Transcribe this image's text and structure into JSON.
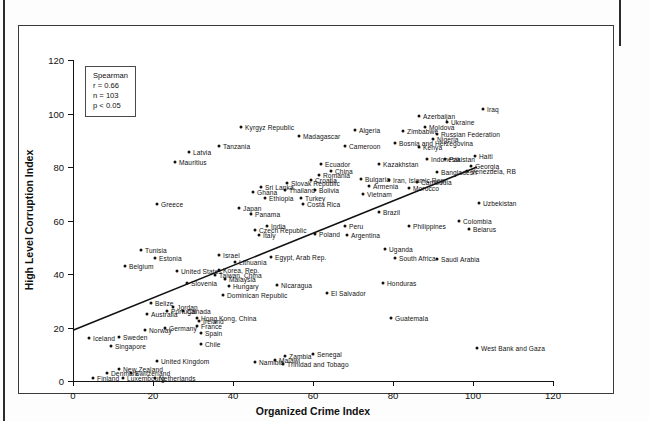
{
  "figure": {
    "stats": {
      "method": "Spearman",
      "r": "r = 0.66",
      "n": "n = 103",
      "p": "p < 0.05"
    }
  },
  "chart_data": {
    "type": "scatter",
    "title": "",
    "xlabel": "Organized Crime Index",
    "ylabel": "High Level Corruption Index",
    "xlim": [
      0,
      120
    ],
    "ylim": [
      0,
      120
    ],
    "xticks": [
      0,
      20,
      40,
      60,
      80,
      100,
      120
    ],
    "yticks": [
      0,
      20,
      40,
      60,
      80,
      100,
      120
    ],
    "grid": false,
    "legend": null,
    "annotation": "Spearman r = 0.66, n = 103, p < 0.05",
    "trendline": {
      "x0": 0,
      "y0": 19,
      "x1": 101,
      "y1": 80
    },
    "point_labels": "country names",
    "points": [
      {
        "label": "Iraq",
        "x": 102.5,
        "y": 101.5,
        "side": "right"
      },
      {
        "label": "Azerbaijan",
        "x": 86.5,
        "y": 99.0,
        "side": "right"
      },
      {
        "label": "Ukraine",
        "x": 93.5,
        "y": 97.0,
        "side": "right"
      },
      {
        "label": "Moldova",
        "x": 88.0,
        "y": 95.0,
        "side": "right"
      },
      {
        "label": "Zimbabwe",
        "x": 82.5,
        "y": 93.5,
        "side": "right"
      },
      {
        "label": "Russian Federation",
        "x": 91.0,
        "y": 92.5,
        "side": "right"
      },
      {
        "label": "Nigeria",
        "x": 90.0,
        "y": 90.5,
        "side": "right"
      },
      {
        "label": "Algeria",
        "x": 70.5,
        "y": 94.0,
        "side": "right"
      },
      {
        "label": "Bosnia and Herzegovina",
        "x": 80.5,
        "y": 89.0,
        "side": "right"
      },
      {
        "label": "Kenya",
        "x": 86.5,
        "y": 87.5,
        "side": "right"
      },
      {
        "label": "Cameroon",
        "x": 68.0,
        "y": 88.0,
        "side": "right"
      },
      {
        "label": "Kyrgyz Republic",
        "x": 42.0,
        "y": 95.0,
        "side": "right"
      },
      {
        "label": "Madagascar",
        "x": 56.5,
        "y": 91.5,
        "side": "right"
      },
      {
        "label": "Tanzania",
        "x": 36.5,
        "y": 88.0,
        "side": "right"
      },
      {
        "label": "Latvia",
        "x": 29.0,
        "y": 85.5,
        "side": "right"
      },
      {
        "label": "Mauritius",
        "x": 25.5,
        "y": 82.0,
        "side": "right"
      },
      {
        "label": "Indonesia",
        "x": 88.5,
        "y": 83.0,
        "side": "right"
      },
      {
        "label": "Pakistan",
        "x": 93.0,
        "y": 83.0,
        "side": "right"
      },
      {
        "label": "Haiti",
        "x": 100.5,
        "y": 84.0,
        "side": "right"
      },
      {
        "label": "Kazakhstan",
        "x": 76.5,
        "y": 81.0,
        "side": "right"
      },
      {
        "label": "Georgia",
        "x": 99.5,
        "y": 80.5,
        "side": "right"
      },
      {
        "label": "Bangladesh",
        "x": 91.0,
        "y": 78.0,
        "side": "right"
      },
      {
        "label": "Venezuela, RB",
        "x": 98.5,
        "y": 78.5,
        "side": "right"
      },
      {
        "label": "Ecuador",
        "x": 62.0,
        "y": 81.0,
        "side": "right"
      },
      {
        "label": "China",
        "x": 64.5,
        "y": 78.5,
        "side": "right"
      },
      {
        "label": "Romania",
        "x": 61.5,
        "y": 77.0,
        "side": "right"
      },
      {
        "label": "Croatia",
        "x": 59.5,
        "y": 75.0,
        "side": "right"
      },
      {
        "label": "Bulgaria",
        "x": 72.0,
        "y": 75.5,
        "side": "right"
      },
      {
        "label": "Iran, Islamic Rep.",
        "x": 79.0,
        "y": 75.0,
        "side": "right"
      },
      {
        "label": "Cambodia",
        "x": 86.0,
        "y": 74.5,
        "side": "right"
      },
      {
        "label": "Armenia",
        "x": 74.0,
        "y": 73.0,
        "side": "right"
      },
      {
        "label": "Morocco",
        "x": 84.0,
        "y": 72.0,
        "side": "right"
      },
      {
        "label": "Slovak Republic",
        "x": 53.5,
        "y": 74.0,
        "side": "right"
      },
      {
        "label": "Sri Lanka",
        "x": 47.0,
        "y": 72.5,
        "side": "right"
      },
      {
        "label": "Thailand",
        "x": 53.0,
        "y": 71.5,
        "side": "right"
      },
      {
        "label": "Bolivia",
        "x": 60.5,
        "y": 71.5,
        "side": "right"
      },
      {
        "label": "Vietnam",
        "x": 72.5,
        "y": 70.0,
        "side": "right"
      },
      {
        "label": "Turkey",
        "x": 57.0,
        "y": 68.5,
        "side": "right"
      },
      {
        "label": "Costa Rica",
        "x": 57.5,
        "y": 66.0,
        "side": "right"
      },
      {
        "label": "Ethiopia",
        "x": 48.0,
        "y": 68.5,
        "side": "right"
      },
      {
        "label": "Ghana",
        "x": 45.0,
        "y": 70.5,
        "side": "right"
      },
      {
        "label": "Uzbekistan",
        "x": 101.5,
        "y": 66.5,
        "side": "right"
      },
      {
        "label": "Greece",
        "x": 21.0,
        "y": 66.0,
        "side": "right"
      },
      {
        "label": "Japan",
        "x": 41.5,
        "y": 64.5,
        "side": "right"
      },
      {
        "label": "Panama",
        "x": 44.5,
        "y": 62.5,
        "side": "right"
      },
      {
        "label": "Brazil",
        "x": 76.5,
        "y": 63.0,
        "side": "right"
      },
      {
        "label": "India",
        "x": 48.5,
        "y": 58.0,
        "side": "right"
      },
      {
        "label": "Czech Republic",
        "x": 45.5,
        "y": 56.5,
        "side": "right"
      },
      {
        "label": "Italy",
        "x": 46.5,
        "y": 54.5,
        "side": "right"
      },
      {
        "label": "Poland",
        "x": 60.5,
        "y": 55.0,
        "side": "right"
      },
      {
        "label": "Peru",
        "x": 68.0,
        "y": 58.0,
        "side": "right"
      },
      {
        "label": "Argentina",
        "x": 68.5,
        "y": 54.5,
        "side": "right"
      },
      {
        "label": "Philippines",
        "x": 84.0,
        "y": 58.0,
        "side": "right"
      },
      {
        "label": "Colombia",
        "x": 96.5,
        "y": 60.0,
        "side": "right"
      },
      {
        "label": "Belarus",
        "x": 99.0,
        "y": 57.0,
        "side": "right"
      },
      {
        "label": "Tunisia",
        "x": 17.0,
        "y": 49.0,
        "side": "right"
      },
      {
        "label": "Estonia",
        "x": 20.5,
        "y": 46.0,
        "side": "right"
      },
      {
        "label": "Belgium",
        "x": 13.0,
        "y": 43.0,
        "side": "right"
      },
      {
        "label": "Israel",
        "x": 36.5,
        "y": 47.0,
        "side": "right"
      },
      {
        "label": "Lithuania",
        "x": 40.5,
        "y": 44.5,
        "side": "right"
      },
      {
        "label": "Egypt, Arab Rep.",
        "x": 49.5,
        "y": 46.5,
        "side": "right"
      },
      {
        "label": "Uganda",
        "x": 78.0,
        "y": 49.5,
        "side": "right"
      },
      {
        "label": "South Africa",
        "x": 80.5,
        "y": 46.0,
        "side": "right"
      },
      {
        "label": "Saudi Arabia",
        "x": 91.0,
        "y": 45.5,
        "side": "right"
      },
      {
        "label": "United States",
        "x": 26.0,
        "y": 41.0,
        "side": "right"
      },
      {
        "label": "Korea, Rep.",
        "x": 36.5,
        "y": 41.5,
        "side": "right"
      },
      {
        "label": "Taiwan, China",
        "x": 35.5,
        "y": 39.5,
        "side": "right"
      },
      {
        "label": "Malaysia",
        "x": 38.0,
        "y": 38.0,
        "side": "right"
      },
      {
        "label": "Hungary",
        "x": 39.0,
        "y": 35.5,
        "side": "right"
      },
      {
        "label": "Slovenia",
        "x": 28.5,
        "y": 36.5,
        "side": "right"
      },
      {
        "label": "Nicaragua",
        "x": 51.0,
        "y": 36.0,
        "side": "right"
      },
      {
        "label": "Honduras",
        "x": 77.5,
        "y": 36.5,
        "side": "right"
      },
      {
        "label": "El Salvador",
        "x": 63.5,
        "y": 33.0,
        "side": "right"
      },
      {
        "label": "Dominican Republic",
        "x": 37.5,
        "y": 32.0,
        "side": "right"
      },
      {
        "label": "Belize",
        "x": 19.5,
        "y": 29.0,
        "side": "right"
      },
      {
        "label": "Jordan",
        "x": 25.0,
        "y": 27.5,
        "side": "right"
      },
      {
        "label": "Portugal",
        "x": 23.5,
        "y": 26.0,
        "side": "right"
      },
      {
        "label": "Canada",
        "x": 27.5,
        "y": 26.0,
        "side": "right"
      },
      {
        "label": "Australia",
        "x": 18.5,
        "y": 25.0,
        "side": "right"
      },
      {
        "label": "Hong Kong, China",
        "x": 31.0,
        "y": 23.5,
        "side": "right"
      },
      {
        "label": "Ireland",
        "x": 31.5,
        "y": 22.5,
        "side": "right"
      },
      {
        "label": "France",
        "x": 31.0,
        "y": 20.5,
        "side": "right"
      },
      {
        "label": "Guatemala",
        "x": 79.5,
        "y": 23.5,
        "side": "right"
      },
      {
        "label": "Germany",
        "x": 23.0,
        "y": 20.0,
        "side": "right"
      },
      {
        "label": "Norway",
        "x": 18.0,
        "y": 19.0,
        "side": "right"
      },
      {
        "label": "Spain",
        "x": 32.0,
        "y": 18.0,
        "side": "right"
      },
      {
        "label": "Sweden",
        "x": 11.5,
        "y": 16.5,
        "side": "right"
      },
      {
        "label": "Iceland",
        "x": 4.0,
        "y": 16.0,
        "side": "right"
      },
      {
        "label": "Singapore",
        "x": 9.5,
        "y": 13.0,
        "side": "right"
      },
      {
        "label": "West Bank and Gaza",
        "x": 101.0,
        "y": 12.5,
        "side": "right"
      },
      {
        "label": "Senegal",
        "x": 60.0,
        "y": 10.0,
        "side": "right"
      },
      {
        "label": "Zambia",
        "x": 53.0,
        "y": 9.5,
        "side": "right"
      },
      {
        "label": "Malawi",
        "x": 50.5,
        "y": 8.0,
        "side": "right"
      },
      {
        "label": "Namibia",
        "x": 45.5,
        "y": 7.0,
        "side": "right"
      },
      {
        "label": "Trinidad and Tobago",
        "x": 52.5,
        "y": 6.5,
        "side": "right"
      },
      {
        "label": "United Kingdom",
        "x": 21.0,
        "y": 7.5,
        "side": "right"
      },
      {
        "label": "New Zealand",
        "x": 11.5,
        "y": 4.5,
        "side": "right"
      },
      {
        "label": "Chile",
        "x": 32.0,
        "y": 14.0,
        "side": "right"
      },
      {
        "label": "Denmark",
        "x": 8.5,
        "y": 3.0,
        "side": "right"
      },
      {
        "label": "Switzerland",
        "x": 14.5,
        "y": 3.0,
        "side": "right"
      },
      {
        "label": "Finland",
        "x": 5.0,
        "y": 1.0,
        "side": "right"
      },
      {
        "label": "Luxembourg",
        "x": 12.5,
        "y": 1.0,
        "side": "right"
      },
      {
        "label": "Netherlands",
        "x": 20.5,
        "y": 1.0,
        "side": "right"
      }
    ]
  }
}
